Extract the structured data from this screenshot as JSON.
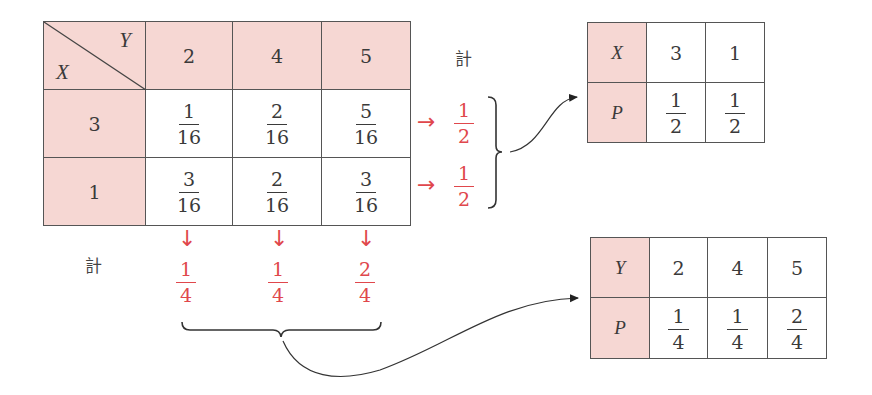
{
  "joint_table": {
    "corner": {
      "row_var": "X",
      "col_var": "Y"
    },
    "col_headers": [
      "2",
      "4",
      "5"
    ],
    "rows": [
      {
        "header": "3",
        "cells": [
          {
            "num": "1",
            "den": "16"
          },
          {
            "num": "2",
            "den": "16"
          },
          {
            "num": "5",
            "den": "16"
          }
        ]
      },
      {
        "header": "1",
        "cells": [
          {
            "num": "3",
            "den": "16"
          },
          {
            "num": "2",
            "den": "16"
          },
          {
            "num": "3",
            "den": "16"
          }
        ]
      }
    ]
  },
  "row_totals": {
    "label": "計",
    "arrow": "→",
    "values": [
      {
        "num": "1",
        "den": "2"
      },
      {
        "num": "1",
        "den": "2"
      }
    ]
  },
  "col_totals": {
    "label": "計",
    "arrow": "↓",
    "values": [
      {
        "num": "1",
        "den": "4"
      },
      {
        "num": "1",
        "den": "4"
      },
      {
        "num": "2",
        "den": "4"
      }
    ]
  },
  "x_distribution": {
    "var_label": "X",
    "prob_label": "P",
    "values": [
      "3",
      "1"
    ],
    "probs": [
      {
        "num": "1",
        "den": "2"
      },
      {
        "num": "1",
        "den": "2"
      }
    ]
  },
  "y_distribution": {
    "var_label": "Y",
    "prob_label": "P",
    "values": [
      "2",
      "4",
      "5"
    ],
    "probs": [
      {
        "num": "1",
        "den": "4"
      },
      {
        "num": "1",
        "den": "4"
      },
      {
        "num": "2",
        "den": "4"
      }
    ]
  },
  "colors": {
    "header_fill": "#f6d7d3",
    "accent_red": "#e0474c",
    "line": "#555555"
  }
}
